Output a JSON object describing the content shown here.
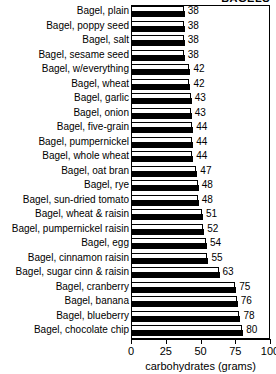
{
  "chart_data": {
    "type": "bar",
    "orientation": "horizontal",
    "title": "BAGELS",
    "xlabel": "carbohydrates (grams)",
    "ylabel": "",
    "xlim": [
      0,
      100
    ],
    "xticks": [
      0,
      25,
      50,
      75,
      100
    ],
    "xticklabels": [
      "0",
      "25",
      "50",
      "75",
      "100"
    ],
    "grid": false,
    "legend": null,
    "value_labels_shown": true,
    "categories": [
      "Bagel, plain",
      "Bagel, poppy seed",
      "Bagel, salt",
      "Bagel, sesame seed",
      "Bagel, w/everything",
      "Bagel, wheat",
      "Bagel, garlic",
      "Bagel, onion",
      "Bagel, five-grain",
      "Bagel, pumpernickel",
      "Bagel, whole wheat",
      "Bagel, oat bran",
      "Bagel, rye",
      "Bagel, sun-dried tomato",
      "Bagel, wheat & raisin",
      "Bagel, pumpernickel raisin",
      "Bagel, egg",
      "Bagel, cinnamon raisin",
      "Bagel, sugar cinn & raisin",
      "Bagel, cranberry",
      "Bagel, banana",
      "Bagel, blueberry",
      "Bagel, chocolate chip"
    ],
    "values": [
      38,
      38,
      38,
      38,
      42,
      42,
      43,
      43,
      44,
      44,
      44,
      47,
      48,
      48,
      51,
      52,
      54,
      55,
      63,
      75,
      76,
      78,
      80
    ]
  },
  "style": {
    "bar_face_color": "#ffffff",
    "bar_edge_color": "#000000",
    "bar_shadow_color": "#000000",
    "background": "#ffffff",
    "text_color": "#000000"
  }
}
